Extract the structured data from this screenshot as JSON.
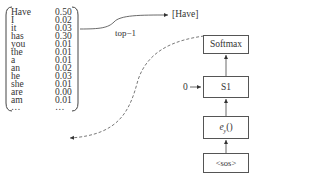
{
  "vocab": {
    "rows": [
      {
        "word": "Have",
        "prob": "0.50"
      },
      {
        "word": "I",
        "prob": "0.02"
      },
      {
        "word": "it",
        "prob": "0.03"
      },
      {
        "word": "has",
        "prob": "0.30"
      },
      {
        "word": "you",
        "prob": "0.01"
      },
      {
        "word": "the",
        "prob": "0.01"
      },
      {
        "word": "a",
        "prob": "0.01"
      },
      {
        "word": "an",
        "prob": "0.02"
      },
      {
        "word": "he",
        "prob": "0.03"
      },
      {
        "word": "she",
        "prob": "0.01"
      },
      {
        "word": "are",
        "prob": "0.00"
      },
      {
        "word": "am",
        "prob": "0.01"
      },
      {
        "word": "…",
        "prob": "…"
      }
    ]
  },
  "output_token": "[Have]",
  "selection_label": "top−1",
  "nodes": {
    "softmax": "Softmax",
    "s1": "S1",
    "embed_base": "e",
    "embed_sub": "y",
    "embed_paren": "()",
    "sos": "<sos>"
  },
  "initial_state": "0"
}
